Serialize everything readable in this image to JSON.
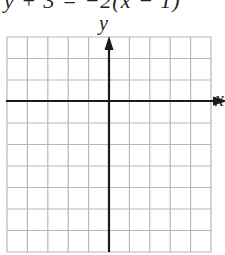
{
  "header": {
    "equation": "y + 3 = −2(x − 1)"
  },
  "graph": {
    "x_axis_label": "x",
    "y_axis_label": "y",
    "grid": {
      "columns": 10,
      "rows": 10,
      "left": 7,
      "right": 211,
      "top": 37,
      "bottom": 252,
      "line_color": "#b8b8b8",
      "axis_color": "#1a1a1a"
    },
    "origin": {
      "x": 109,
      "y": 101
    }
  }
}
